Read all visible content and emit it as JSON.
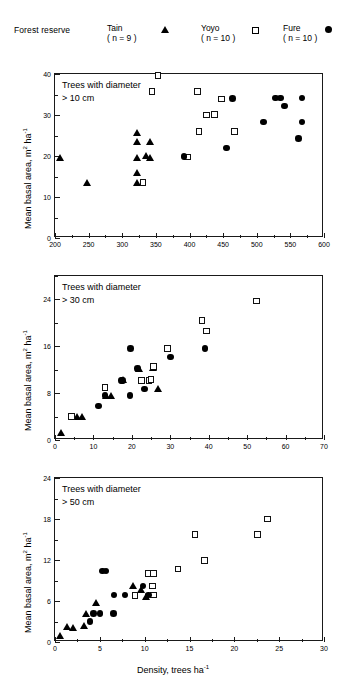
{
  "legend": {
    "title": "Forest reserve",
    "entries": [
      {
        "name": "Tain",
        "n": "( n = 9 )",
        "marker": "triangle-icon"
      },
      {
        "name": "Yoyo",
        "n": "( n = 10 )",
        "marker": "square-icon"
      },
      {
        "name": "Fure",
        "n": "( n = 10 )",
        "marker": "circle-icon"
      }
    ]
  },
  "axis": {
    "ylabel_text": "Mean basal area, m",
    "ylabel_sup1": "2",
    "ylabel_mid": " ha",
    "ylabel_sup2": "-1",
    "xlabel_text": "Density, trees ha",
    "xlabel_sup": "-1"
  },
  "chart_data": [
    {
      "type": "scatter",
      "title": "",
      "annotation_line1": "Trees with diameter",
      "annotation_line2": "> 10 cm",
      "xlabel": "",
      "ylabel": "Mean basal area, m2 ha-1",
      "xlim": [
        200,
        600
      ],
      "ylim": [
        0,
        40
      ],
      "xticks": [
        200,
        250,
        300,
        350,
        400,
        450,
        500,
        550,
        600
      ],
      "yticks": [
        0,
        10,
        20,
        30,
        40
      ],
      "grid": false,
      "legend_position": "top-external",
      "series": [
        {
          "name": "Tain",
          "marker": "triangle",
          "points": [
            [
              208,
              19.6
            ],
            [
              248,
              13.6
            ],
            [
              322,
              25.8
            ],
            [
              322,
              23.5
            ],
            [
              322,
              19.7
            ],
            [
              322,
              16.0
            ],
            [
              322,
              13.6
            ],
            [
              341,
              23.5
            ],
            [
              341,
              19.7
            ],
            [
              336,
              20.0
            ]
          ]
        },
        {
          "name": "Yoyo",
          "marker": "square",
          "points": [
            [
              353,
              39.6
            ],
            [
              344,
              35.8
            ],
            [
              331,
              13.6
            ],
            [
              397,
              19.8
            ],
            [
              412,
              35.8
            ],
            [
              414,
              26.0
            ],
            [
              425,
              30.0
            ],
            [
              437,
              30.1
            ],
            [
              448,
              33.9
            ],
            [
              467,
              26.0
            ]
          ]
        },
        {
          "name": "Fure",
          "marker": "circle",
          "points": [
            [
              392,
              19.9
            ],
            [
              464,
              34.0
            ],
            [
              455,
              22.0
            ],
            [
              510,
              28.3
            ],
            [
              528,
              34.1
            ],
            [
              535,
              34.1
            ],
            [
              541,
              32.2
            ],
            [
              567,
              34.1
            ],
            [
              567,
              28.3
            ],
            [
              562,
              24.3
            ]
          ]
        }
      ]
    },
    {
      "type": "scatter",
      "title": "",
      "annotation_line1": "Trees with diameter",
      "annotation_line2": "> 30 cm",
      "xlabel": "",
      "ylabel": "Mean basal area, m2 ha-1",
      "xlim": [
        0,
        70
      ],
      "ylim": [
        0,
        28
      ],
      "xticks": [
        0,
        10,
        20,
        30,
        40,
        50,
        60,
        70
      ],
      "yticks": [
        0,
        8,
        16,
        24
      ],
      "grid": false,
      "legend_position": "top-external",
      "series": [
        {
          "name": "Tain",
          "marker": "triangle",
          "points": [
            [
              1.6,
              1.3
            ],
            [
              5.6,
              4.0
            ],
            [
              6.9,
              4.0
            ],
            [
              13.2,
              7.5
            ],
            [
              14.5,
              7.5
            ],
            [
              17.8,
              10.3
            ],
            [
              21.9,
              12.2
            ],
            [
              25.6,
              12.4
            ],
            [
              26.7,
              8.8
            ]
          ]
        },
        {
          "name": "Yoyo",
          "marker": "square",
          "points": [
            [
              4.3,
              4.0
            ],
            [
              13.0,
              9.0
            ],
            [
              22.5,
              10.2
            ],
            [
              24.5,
              10.2
            ],
            [
              25.0,
              10.3
            ],
            [
              25.6,
              12.5
            ],
            [
              29.3,
              15.6
            ],
            [
              38.2,
              20.4
            ],
            [
              39.4,
              18.6
            ],
            [
              52.4,
              23.7
            ]
          ]
        },
        {
          "name": "Fure",
          "marker": "circle",
          "points": [
            [
              11.3,
              5.8
            ],
            [
              13.0,
              7.6
            ],
            [
              17.3,
              10.2
            ],
            [
              17.6,
              10.2
            ],
            [
              19.6,
              15.6
            ],
            [
              19.5,
              7.6
            ],
            [
              21.4,
              12.2
            ],
            [
              23.3,
              8.7
            ],
            [
              30.0,
              14.2
            ],
            [
              39.0,
              15.6
            ]
          ]
        }
      ]
    },
    {
      "type": "scatter",
      "title": "",
      "annotation_line1": "Trees with diameter",
      "annotation_line2": "> 50 cm",
      "xlabel": "Density, trees ha-1",
      "ylabel": "Mean basal area, m2 ha-1",
      "xlim": [
        0,
        30
      ],
      "ylim": [
        0,
        24
      ],
      "xticks": [
        0,
        5,
        10,
        15,
        20,
        25,
        30
      ],
      "yticks": [
        0,
        6,
        12,
        18,
        24
      ],
      "grid": false,
      "legend_position": "top-external",
      "series": [
        {
          "name": "Tain",
          "marker": "triangle",
          "points": [
            [
              0.6,
              1.0
            ],
            [
              1.3,
              2.3
            ],
            [
              2.0,
              2.1
            ],
            [
              3.2,
              2.4
            ],
            [
              3.5,
              4.1
            ],
            [
              4.6,
              5.8
            ],
            [
              8.7,
              8.3
            ],
            [
              9.6,
              7.6
            ],
            [
              10.1,
              6.7
            ]
          ]
        },
        {
          "name": "Yoyo",
          "marker": "square",
          "points": [
            [
              8.9,
              6.8
            ],
            [
              10.4,
              10.0
            ],
            [
              11.0,
              10.0
            ],
            [
              10.9,
              8.2
            ],
            [
              11.0,
              6.9
            ],
            [
              13.7,
              10.7
            ],
            [
              15.6,
              15.7
            ],
            [
              16.7,
              11.9
            ],
            [
              22.6,
              15.7
            ],
            [
              23.7,
              18.0
            ]
          ]
        },
        {
          "name": "Fure",
          "marker": "circle",
          "points": [
            [
              3.9,
              3.0
            ],
            [
              4.3,
              4.2
            ],
            [
              5.0,
              4.2
            ],
            [
              5.3,
              10.4
            ],
            [
              5.7,
              10.4
            ],
            [
              6.5,
              4.2
            ],
            [
              6.6,
              6.9
            ],
            [
              7.8,
              6.9
            ],
            [
              9.8,
              8.2
            ],
            [
              10.4,
              6.9
            ]
          ]
        }
      ]
    }
  ]
}
